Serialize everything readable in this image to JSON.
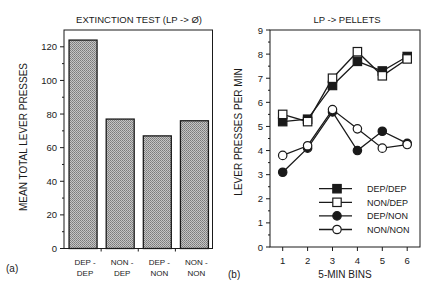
{
  "panels": {
    "a": {
      "label": "(a)"
    },
    "b": {
      "label": "(b)"
    }
  },
  "colors": {
    "ink": "#1a1a1a",
    "bar_fill": "#a8a8a8",
    "background": "#ffffff"
  },
  "chart_data": [
    {
      "type": "bar",
      "panel": "(a)",
      "title": "EXTINCTION TEST (LP -> Ø)",
      "xlabel": "",
      "ylabel": "MEAN TOTAL LEVER PRESSES",
      "categories": [
        "DEP - DEP",
        "NON - DEP",
        "DEP - NON",
        "NON - NON"
      ],
      "category_lines": [
        [
          "DEP -",
          "DEP"
        ],
        [
          "NON -",
          "DEP"
        ],
        [
          "DEP -",
          "NON"
        ],
        [
          "NON -",
          "NON"
        ]
      ],
      "values": [
        124,
        77,
        67,
        76
      ],
      "ylim": [
        0,
        130
      ],
      "yticks": [
        0,
        20,
        40,
        60,
        80,
        100,
        120
      ],
      "grid": false,
      "bar_pattern": "crosshatch-gray"
    },
    {
      "type": "line",
      "panel": "(b)",
      "title": "LP -> PELLETS",
      "xlabel": "5-MIN BINS",
      "ylabel": "LEVER PRESSES PER MIN",
      "x": [
        1,
        2,
        3,
        4,
        5,
        6
      ],
      "ylim": [
        0,
        9
      ],
      "yticks": [
        0,
        1,
        2,
        3,
        4,
        5,
        6,
        7,
        8,
        9
      ],
      "grid": false,
      "legend_position": "lower right (inside)",
      "series": [
        {
          "name": "DEP/DEP",
          "marker": "filled-square",
          "values": [
            5.2,
            5.3,
            6.7,
            7.7,
            7.3,
            7.9
          ]
        },
        {
          "name": "NON/DEP",
          "marker": "open-square",
          "values": [
            5.5,
            5.2,
            7.0,
            8.1,
            7.1,
            7.8
          ]
        },
        {
          "name": "DEP/NON",
          "marker": "filled-circle",
          "values": [
            3.1,
            4.1,
            5.6,
            4.0,
            4.8,
            4.3
          ]
        },
        {
          "name": "NON/NON",
          "marker": "open-circle",
          "values": [
            3.8,
            4.2,
            5.7,
            4.9,
            4.1,
            4.25
          ]
        }
      ]
    }
  ]
}
